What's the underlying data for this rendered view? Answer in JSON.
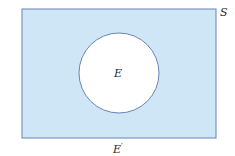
{
  "diagram": {
    "type": "venn",
    "colors": {
      "universe_fill": "#cfe6f6",
      "universe_stroke": "#6b84b4",
      "event_fill": "#ffffff",
      "event_stroke": "#6b84b4"
    },
    "universe": {
      "label": "S",
      "x": 22,
      "y": 9,
      "width": 194,
      "height": 129
    },
    "event": {
      "label": "E",
      "cx": 119,
      "cy": 73,
      "r": 40
    },
    "complement": {
      "label": "E",
      "prime": "′"
    }
  }
}
